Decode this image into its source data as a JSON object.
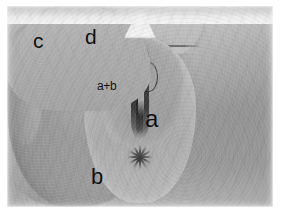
{
  "figure": {
    "kind": "clinical-photograph",
    "modality": "grayscale photograph",
    "orientation": "anterior-superior at top, posterior-inferior at bottom",
    "plate_background_color": "#ffffff",
    "plate_tone_color": "#a9a8a4",
    "annotation_color": "#0d0d0d"
  },
  "annotations": {
    "label_c": "c",
    "label_d": "d",
    "label_a_plus_b": "a+b",
    "label_a": "a",
    "label_b": "b"
  },
  "regions": {
    "left_thigh": "left thigh / medial thigh surface",
    "right_thigh": "right thigh / medial thigh surface",
    "mons_plate": "suprapubic mound",
    "suprapubic_crease": "transverse suprapubic crease",
    "inguinal_crease_left": "left inguinal crease",
    "inguinal_crease_right": "right inguinal crease",
    "perineal_oval": "central perineal field",
    "vulval_body": "labial body",
    "midline_cleft": "midline cleft",
    "anus": "stellate anal opening",
    "gluteal_notch": "inferior gluteal notch"
  }
}
